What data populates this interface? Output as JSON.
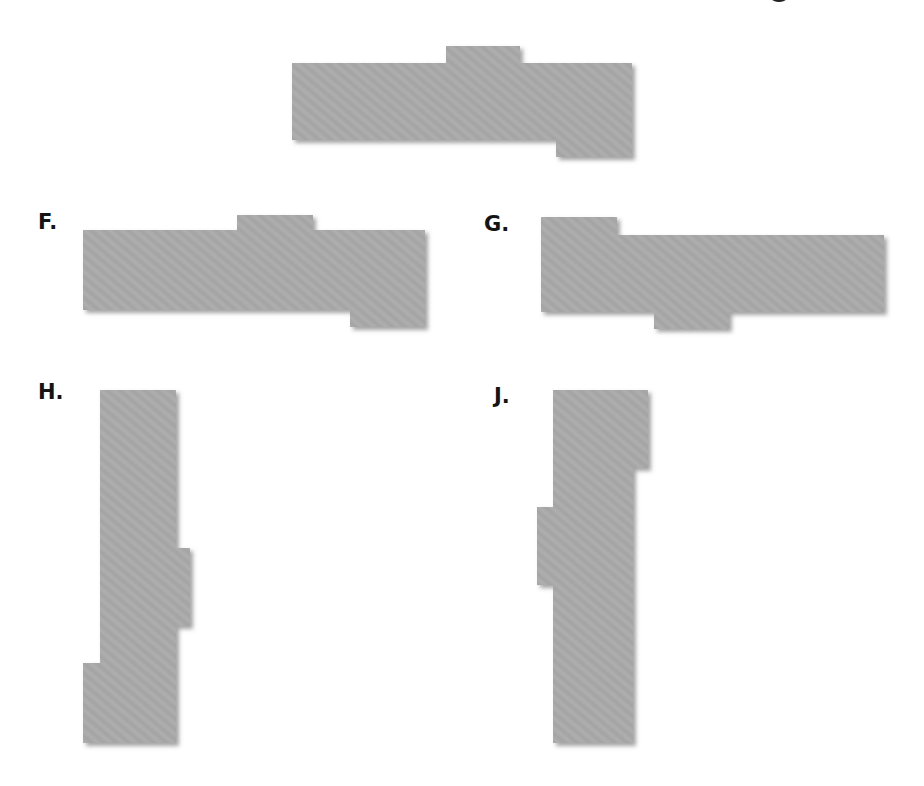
{
  "figure": {
    "reference_shape": {
      "label": "",
      "orientation": "horizontal",
      "description": "long bar with tab on top-middle and tab on bottom-right"
    },
    "options": [
      {
        "label": "F.",
        "orientation": "horizontal",
        "description": "long bar with tab on top-middle and tab on bottom-right"
      },
      {
        "label": "G.",
        "orientation": "horizontal",
        "description": "long bar with tab on top-left and tab on bottom-middle"
      },
      {
        "label": "H.",
        "orientation": "vertical",
        "description": "tall bar with tab on right-middle and tab on bottom-left"
      },
      {
        "label": "J.",
        "orientation": "vertical",
        "description": "tall bar with tab on top-right and tab on left-middle"
      }
    ],
    "colors": {
      "shape_fill": "#a9a9a9",
      "shape_shadow": "#6b6b6b",
      "label_text": "#141414",
      "background": "#ffffff"
    }
  }
}
